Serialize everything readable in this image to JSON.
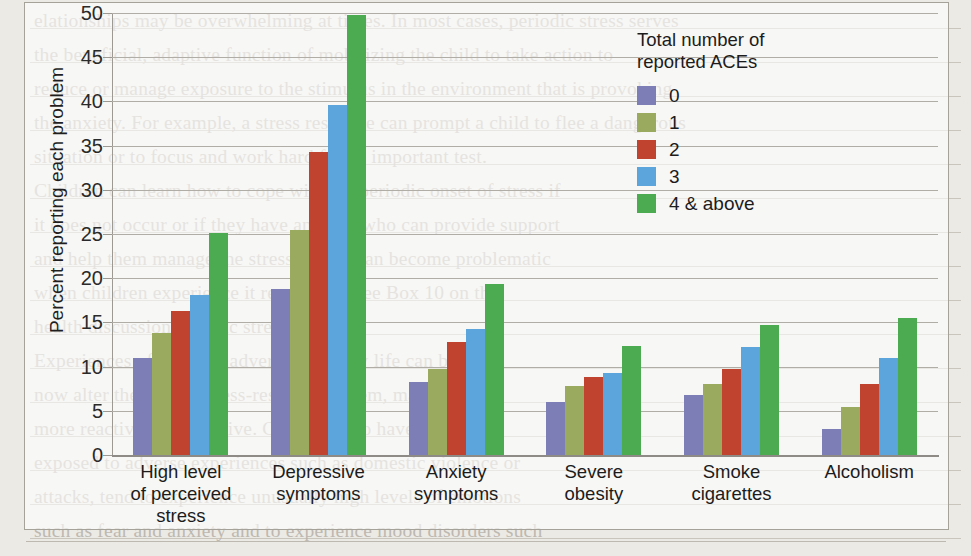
{
  "chart_data": {
    "type": "bar",
    "title": "",
    "xlabel": "",
    "ylabel": "Percent reporting each problem",
    "ylim": [
      0,
      50
    ],
    "yticks": [
      0,
      5,
      10,
      15,
      20,
      25,
      30,
      35,
      40,
      45,
      50
    ],
    "grid": true,
    "legend_position": "upper-right",
    "legend_title": "Total number of\nreported ACEs",
    "categories": [
      "High level\nof perceived\nstress",
      "Depressive\nsymptoms",
      "Anxiety\nsymptoms",
      "Severe\nobesity",
      "Smoke\ncigarettes",
      "Alcoholism"
    ],
    "series": [
      {
        "name": "0",
        "color": "#7d7eb5",
        "values": [
          11.0,
          18.8,
          8.3,
          6.0,
          6.8,
          2.9
        ]
      },
      {
        "name": "1",
        "color": "#9aaa5f",
        "values": [
          13.8,
          25.5,
          9.7,
          7.8,
          8.0,
          5.4
        ]
      },
      {
        "name": "2",
        "color": "#c0432f",
        "values": [
          16.3,
          34.3,
          12.8,
          8.8,
          9.7,
          8.0
        ]
      },
      {
        "name": "3",
        "color": "#5ba5dc",
        "values": [
          18.1,
          39.6,
          14.3,
          9.3,
          12.2,
          11.0
        ]
      },
      {
        "name": "4 & above",
        "color": "#4caa50",
        "values": [
          25.1,
          49.8,
          19.3,
          12.3,
          14.7,
          15.5
        ]
      }
    ]
  },
  "legend": {
    "title_line1": "Total number of",
    "title_line2": "reported ACEs"
  },
  "background_text": {
    "lines": [
      "elationships may be overwhelming at times. In most cases, periodic stress serves",
      "the beneficial, adaptive function of mobilizing the child to take action to",
      "reduce or manage exposure to the stimulus in the environment that is provoking",
      "the anxiety. For example, a stress response can prompt a child to flee a dangerous",
      "situation or to focus and work hard for an important test.",
      "   Children can learn how to cope with the periodic onset of stress if",
      "it does not occur or if they have an adult who can provide support",
      "and help them manage the stress. Stress can become problematic",
      "when children experience it repeatedly (see Box 10 on the",
      "health discussion of toxic stress.)",
      "   Experiences of stress or adversity in early life can become",
      "   now alter the brain's stress-response system, making it",
      "   more reactive and sensitive. Children who have been",
      "   exposed to adverse experiences such as domestic violence or",
      "   attacks, tend to experience unusually high levels of emotions",
      "   such as fear and anxiety and to experience mood disorders such"
    ]
  }
}
